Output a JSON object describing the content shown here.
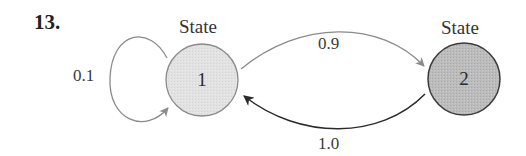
{
  "problem": {
    "number": "13."
  },
  "states": [
    {
      "id": "1",
      "title": "State",
      "label": "1",
      "fill": "#e4e4e4",
      "stroke": "#8a8a8a"
    },
    {
      "id": "2",
      "title": "State",
      "label": "2",
      "fill": "#bdbdbd",
      "stroke": "#3a3a3a"
    }
  ],
  "transitions": [
    {
      "from": "1",
      "to": "1",
      "probability": "0.1",
      "color": "#8a8a8a"
    },
    {
      "from": "1",
      "to": "2",
      "probability": "0.9",
      "color": "#8a8a8a"
    },
    {
      "from": "2",
      "to": "1",
      "probability": "1.0",
      "color": "#2a2a2a"
    }
  ]
}
